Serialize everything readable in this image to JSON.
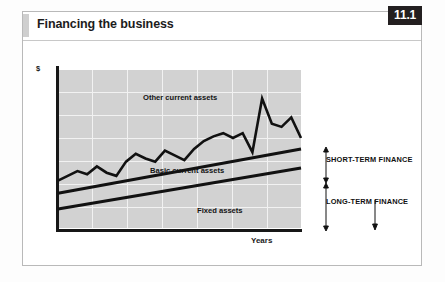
{
  "header": {
    "title": "Financing the business",
    "badge": "11.1"
  },
  "chart_data": {
    "type": "line",
    "title": "Financing the business",
    "xlabel": "Years",
    "ylabel": "$",
    "grid": true,
    "legend_position": "inline-annotations",
    "xlim": [
      0,
      100
    ],
    "ylim": [
      0,
      100
    ],
    "annotations": [
      {
        "name": "other-current-assets",
        "text": "Other current assets"
      },
      {
        "name": "basic-current-assets",
        "text": "Basic current assets"
      },
      {
        "name": "fixed-assets",
        "text": "Fixed assets"
      },
      {
        "name": "short-term-finance",
        "text": "SHORT-TERM FINANCE"
      },
      {
        "name": "long-term-finance",
        "text": "LONG-TERM FINANCE"
      }
    ],
    "series": [
      {
        "name": "Other current assets",
        "style": "jagged",
        "x": [
          0,
          4,
          8,
          12,
          16,
          20,
          24,
          28,
          32,
          36,
          40,
          44,
          48,
          52,
          56,
          60,
          64,
          68,
          72,
          76,
          80,
          84,
          88,
          92,
          96,
          100
        ],
        "y": [
          30,
          33,
          36,
          34,
          39,
          35,
          33,
          42,
          47,
          44,
          42,
          49,
          46,
          43,
          50,
          55,
          58,
          60,
          57,
          60,
          48,
          82,
          66,
          64,
          70,
          57
        ]
      },
      {
        "name": "Basic current assets",
        "style": "straight",
        "x": [
          0,
          100
        ],
        "y": [
          22,
          50
        ]
      },
      {
        "name": "Fixed assets",
        "style": "straight",
        "x": [
          0,
          100
        ],
        "y": [
          12,
          38
        ]
      }
    ]
  },
  "axis": {
    "y_unit": "$",
    "x_caption": "Years"
  }
}
